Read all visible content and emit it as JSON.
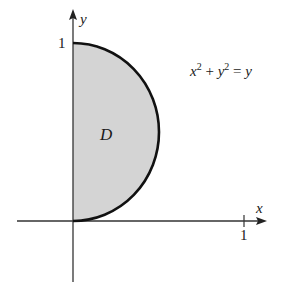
{
  "figure": {
    "region_label": "D",
    "curve_equation": {
      "x": "x",
      "x_exp": "2",
      "plus": " + ",
      "y": "y",
      "y_exp": "2",
      "equals": " = ",
      "rhs": "y"
    },
    "axes": {
      "x_label": "x",
      "y_label": "y",
      "x_tick_label": "1",
      "y_tick_label": "1"
    },
    "colors": {
      "region_fill": "#d4d4d4",
      "curve": "#111111",
      "axis": "#333333"
    }
  }
}
